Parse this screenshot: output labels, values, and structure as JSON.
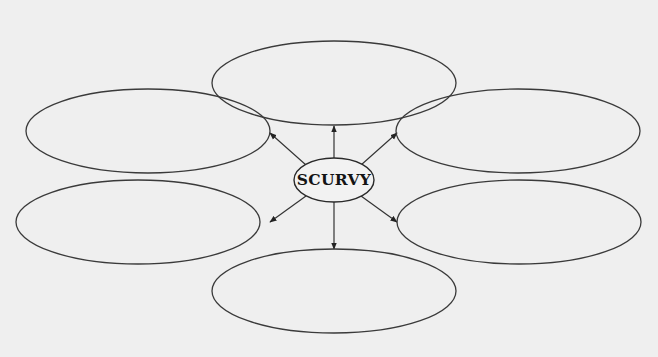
{
  "diagram": {
    "type": "concept-map",
    "center": {
      "label": "SCURVY",
      "cx": 334,
      "cy": 180,
      "rx": 40,
      "ry": 22
    },
    "branches": [
      {
        "id": "top",
        "label": "",
        "cx": 334,
        "cy": 83,
        "rx": 122,
        "ry": 42
      },
      {
        "id": "upper-left",
        "label": "",
        "cx": 148,
        "cy": 131,
        "rx": 122,
        "ry": 42
      },
      {
        "id": "upper-right",
        "label": "",
        "cx": 518,
        "cy": 131,
        "rx": 122,
        "ry": 42
      },
      {
        "id": "lower-left",
        "label": "",
        "cx": 138,
        "cy": 222,
        "rx": 122,
        "ry": 42
      },
      {
        "id": "lower-right",
        "label": "",
        "cx": 519,
        "cy": 222,
        "rx": 122,
        "ry": 42
      },
      {
        "id": "bottom",
        "label": "",
        "cx": 334,
        "cy": 291,
        "rx": 122,
        "ry": 42
      }
    ],
    "edges": [
      {
        "to": "top",
        "x1": 334,
        "y1": 158,
        "x2": 334,
        "y2": 126
      },
      {
        "to": "upper-left",
        "x1": 306,
        "y1": 165,
        "x2": 270,
        "y2": 133
      },
      {
        "to": "upper-right",
        "x1": 361,
        "y1": 165,
        "x2": 397,
        "y2": 133
      },
      {
        "to": "lower-left",
        "x1": 306,
        "y1": 196,
        "x2": 270,
        "y2": 222
      },
      {
        "to": "lower-right",
        "x1": 361,
        "y1": 196,
        "x2": 397,
        "y2": 222
      },
      {
        "to": "bottom",
        "x1": 334,
        "y1": 202,
        "x2": 334,
        "y2": 249
      }
    ],
    "colors": {
      "stroke": "#3a3a3a",
      "background": "#efefef",
      "text": "#141414"
    }
  }
}
